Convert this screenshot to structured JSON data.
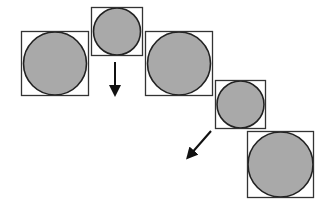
{
  "diagram": {
    "width": 326,
    "height": 208,
    "background": "#ffffff",
    "colors": {
      "circle_fill": "#a9a9a9",
      "circle_stroke": "#222222",
      "box_stroke": "#333333",
      "arrow": "#111111"
    },
    "cells": [
      {
        "id": "cell-1",
        "size": "large",
        "box": {
          "x": 21,
          "y": 31,
          "w": 67,
          "h": 64
        }
      },
      {
        "id": "cell-2",
        "size": "small",
        "box": {
          "x": 91,
          "y": 7,
          "w": 51,
          "h": 48
        }
      },
      {
        "id": "cell-3",
        "size": "large",
        "box": {
          "x": 145,
          "y": 31,
          "w": 67,
          "h": 64
        }
      },
      {
        "id": "cell-4",
        "size": "small",
        "box": {
          "x": 215,
          "y": 80,
          "w": 50,
          "h": 48
        }
      },
      {
        "id": "cell-5",
        "size": "large",
        "box": {
          "x": 247,
          "y": 131,
          "w": 66,
          "h": 66
        }
      }
    ],
    "arrows": [
      {
        "id": "arrow-down",
        "direction": "down",
        "x1": 115,
        "y1": 62,
        "x2": 115,
        "y2": 91
      },
      {
        "id": "arrow-down-left",
        "direction": "down-left",
        "x1": 211,
        "y1": 131,
        "x2": 190,
        "y2": 155
      }
    ]
  }
}
